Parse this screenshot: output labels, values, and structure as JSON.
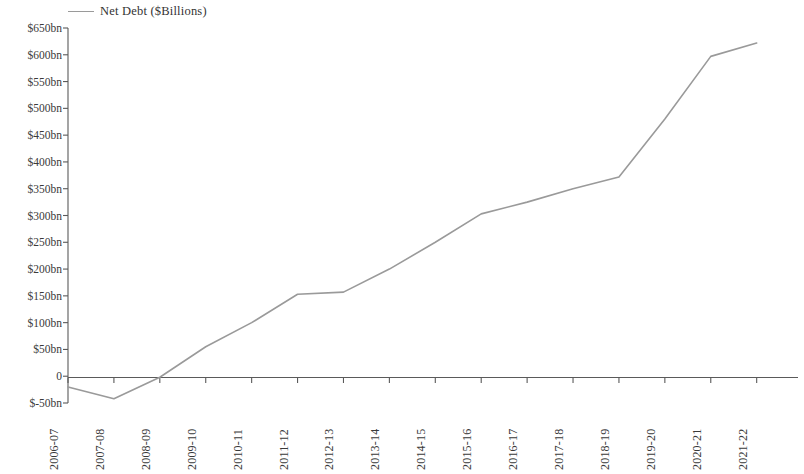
{
  "legend": {
    "entries": [
      {
        "label": "Net Debt ($Billions)",
        "color": "#9a9a9a",
        "marker": "line-swatch"
      }
    ],
    "position": "top-left"
  },
  "axes": {
    "y_tick_labels": [
      "$650bn",
      "$600bn",
      "$550bn",
      "$500bn",
      "$450bn",
      "$400bn",
      "$350bn",
      "$300bn",
      "$250bn",
      "$200bn",
      "$150bn",
      "$100bn",
      "$50bn",
      "0",
      "$-50bn"
    ],
    "y_tick_values": [
      650,
      600,
      550,
      500,
      450,
      400,
      350,
      300,
      250,
      200,
      150,
      100,
      50,
      0,
      -50
    ],
    "x_tick_labels": [
      "2006-07",
      "2007-08",
      "2008-09",
      "2009-10",
      "2010-11",
      "2011-12",
      "2012-13",
      "2013-14",
      "2014-15",
      "2015-16",
      "2016-17",
      "2017-18",
      "2018-19",
      "2019-20",
      "2020-21",
      "2021-22"
    ]
  },
  "chart_data": {
    "type": "line",
    "title": "",
    "subtitle": "",
    "xlabel": "",
    "ylabel": "",
    "categories": [
      "2006-07",
      "2007-08",
      "2008-09",
      "2009-10",
      "2010-11",
      "2011-12",
      "2012-13",
      "2013-14",
      "2014-15",
      "2015-16",
      "2016-17",
      "2017-18",
      "2018-19",
      "2019-20",
      "2020-21",
      "2021-22"
    ],
    "series": [
      {
        "name": "Net Debt ($Billions)",
        "color": "#9a9a9a",
        "values": [
          -20,
          -42,
          -2,
          55,
          100,
          153,
          157,
          200,
          250,
          303,
          325,
          350,
          372,
          480,
          597,
          622
        ]
      }
    ],
    "ylim": [
      -50,
      650
    ],
    "y_tick_step": 50,
    "y_unit": "$bn",
    "grid": false,
    "legend_position": "top-left",
    "zero_line": true
  }
}
